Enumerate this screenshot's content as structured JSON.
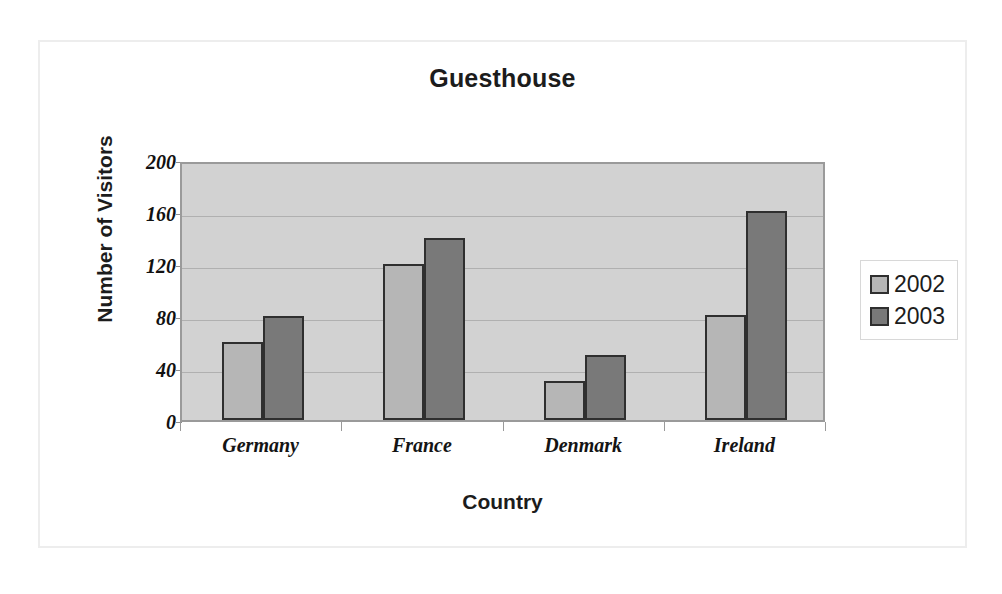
{
  "chart_data": {
    "type": "bar",
    "title": "Guesthouse",
    "xlabel": "Country",
    "ylabel": "Number of Visitors",
    "categories": [
      "Germany",
      "France",
      "Denmark",
      "Ireland"
    ],
    "series": [
      {
        "name": "2002",
        "values": [
          60,
          120,
          30,
          81
        ],
        "color": "#b6b6b6"
      },
      {
        "name": "2003",
        "values": [
          80,
          140,
          50,
          161
        ],
        "color": "#797979"
      }
    ],
    "ylim": [
      0,
      200
    ],
    "yticks": [
      0,
      40,
      80,
      120,
      160,
      200
    ],
    "ytick_labels": [
      "0",
      "40",
      "80",
      "120",
      "160",
      "200"
    ],
    "grid": true,
    "legend_position": "right",
    "plot_background": "#d2d2d2"
  }
}
